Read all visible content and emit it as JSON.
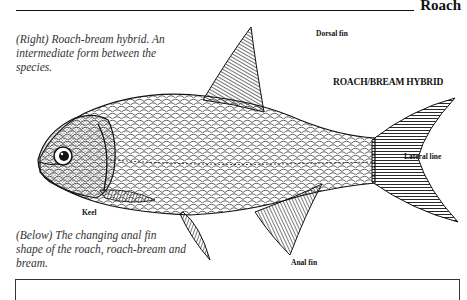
{
  "header": {
    "title": "Roach"
  },
  "captions": {
    "right": "(Right) Roach-bream hybrid. An intermediate form between the species.",
    "below": "(Below) The changing anal fin shape of the roach, roach-bream and bream."
  },
  "illustration": {
    "heading": "ROACH/BREAM HYBRID",
    "labels": {
      "dorsal_fin": "Dorsal fin",
      "lateral_line": "Lateral line",
      "keel": "Keel",
      "anal_fin": "Anal fin"
    }
  },
  "colors": {
    "ink": "#111111",
    "paper": "#ffffff",
    "caption": "#333333"
  }
}
